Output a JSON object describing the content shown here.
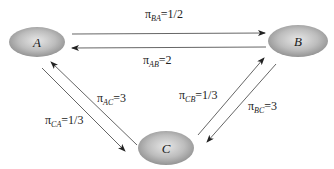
{
  "diagram": {
    "type": "state-transition",
    "colors": {
      "node_fill_center": "#e4e4e4",
      "node_fill_edge": "#8c8c8c",
      "edge": "#555555",
      "text": "#222222"
    },
    "nodes": [
      {
        "id": "A",
        "label": "A",
        "cx": 37,
        "cy": 42,
        "rx": 28,
        "ry": 15
      },
      {
        "id": "B",
        "label": "B",
        "cx": 298,
        "cy": 41,
        "rx": 30,
        "ry": 16
      },
      {
        "id": "C",
        "label": "C",
        "cx": 166,
        "cy": 148,
        "rx": 28,
        "ry": 17
      }
    ],
    "edges": [
      {
        "from": "A",
        "to": "B",
        "symbol": "π",
        "sub": "BA",
        "value": "=1/2"
      },
      {
        "from": "B",
        "to": "A",
        "symbol": "π",
        "sub": "AB",
        "value": "=2"
      },
      {
        "from": "C",
        "to": "A",
        "symbol": "π",
        "sub": "AC",
        "value": "=3"
      },
      {
        "from": "A",
        "to": "C",
        "symbol": "π",
        "sub": "CA",
        "value": "=1/3"
      },
      {
        "from": "C",
        "to": "B",
        "symbol": "π",
        "sub": "CB",
        "value": "=1/3"
      },
      {
        "from": "B",
        "to": "C",
        "symbol": "π",
        "sub": "BC",
        "value": "=3"
      }
    ]
  }
}
